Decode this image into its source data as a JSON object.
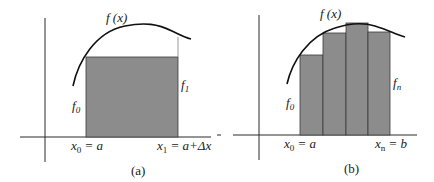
{
  "colors": {
    "axis": "#2a2a2a",
    "curve": "#111111",
    "fill": "#8c8c8c",
    "bar_edge": "#3a3a3a",
    "guide": "#9a9a9a",
    "text": "#1a1a1a"
  },
  "panels": [
    {
      "id": "a",
      "caption": "(a)",
      "curve_label": "f (x)",
      "left_label": {
        "base": "f",
        "sub": "0"
      },
      "right_label": {
        "base": "f",
        "sub": "1"
      },
      "x_left": {
        "base": "x",
        "sub": "0",
        "rest": " = a"
      },
      "x_right": {
        "base": "x",
        "sub": "1",
        "rest": " = a+Δx"
      },
      "rectangles": 1
    },
    {
      "id": "b",
      "caption": "(b)",
      "curve_label": "f (x)",
      "left_label": {
        "base": "f",
        "sub": "0"
      },
      "right_label": {
        "base": "f",
        "sub": "n"
      },
      "x_left": {
        "base": "x",
        "sub": "0",
        "rest": " = a"
      },
      "x_right": {
        "base": "x",
        "sub": "n",
        "rest": " = b"
      },
      "rectangles": 4
    }
  ]
}
